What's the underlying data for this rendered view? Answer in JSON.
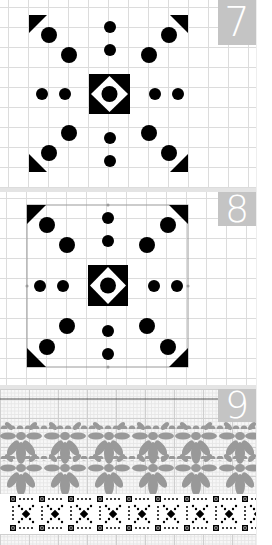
{
  "panels": [
    {
      "number": "7",
      "style": "solid-black-on-grid",
      "motif": "square medallion: corner triangles, diagonal dots, central diamond window with dot"
    },
    {
      "number": "8",
      "style": "black-motif-with-outline-bounding-box",
      "motif": "same square medallion with thin outline frame"
    },
    {
      "number": "9",
      "style": "repeating-bands-on-fine-grid",
      "motif": "two rows of grey petal flowers above a black dotted X border band"
    }
  ],
  "colors": {
    "ink": "#000000",
    "grid_line": "#dcdcdc",
    "label_bg": "#c4c4c4",
    "label_text": "#ffffff",
    "flower_grey": "#999999",
    "background": "#ffffff"
  }
}
